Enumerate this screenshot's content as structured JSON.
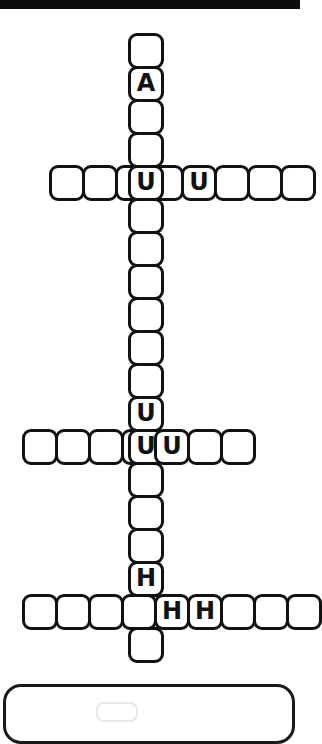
{
  "app": {
    "type": "crossword-puzzle",
    "title": "Crossword Grid",
    "background_color": "#ffffff",
    "ink_color": "#111111",
    "topbar_color": "#0d0d0d"
  },
  "grid": {
    "cell_size": 33,
    "origin_x": 128,
    "origin_y": 33,
    "columns_note": "single long vertical entry crossed by three horizontal entries"
  },
  "entries": [
    {
      "id": "vertical-main",
      "direction": "down",
      "length": 19,
      "start_x": 128,
      "start_y": 33,
      "letters": [
        "",
        "A",
        "",
        "",
        "U",
        "",
        "",
        "",
        "",
        "",
        "",
        "U",
        "",
        "",
        "",
        "",
        "H",
        "",
        ""
      ]
    },
    {
      "id": "across-1",
      "direction": "across",
      "length": 8,
      "start_x": 49,
      "start_y": 165,
      "crossing_index": 4,
      "letters": [
        "",
        "",
        "",
        "",
        "U",
        "",
        "",
        ""
      ]
    },
    {
      "id": "across-2",
      "direction": "across",
      "length": 7,
      "start_x": 22,
      "start_y": 429,
      "crossing_index": 4,
      "letters": [
        "",
        "",
        "",
        "",
        "U",
        "",
        ""
      ]
    },
    {
      "id": "across-3",
      "direction": "across",
      "length": 9,
      "start_x": 22,
      "start_y": 594,
      "crossing_index": 4,
      "letters": [
        "",
        "",
        "",
        "",
        "",
        "H",
        "",
        "",
        ""
      ]
    }
  ],
  "filled_letters": [
    {
      "letter": "A",
      "x": 128,
      "y": 66
    },
    {
      "letter": "U",
      "x": 161,
      "y": 165
    },
    {
      "letter": "U",
      "x": 128,
      "y": 429
    },
    {
      "letter": "H",
      "x": 154,
      "y": 594
    }
  ],
  "bottom_panel": {
    "label": "",
    "visible": true
  }
}
